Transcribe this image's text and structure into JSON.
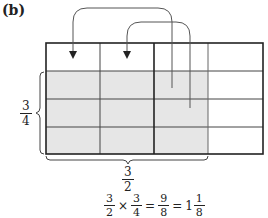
{
  "figure": {
    "part_label": "(b)",
    "grid": {
      "columns": 4,
      "rows": 4,
      "shaded_columns": 3,
      "shaded_rows_from_bottom": 3,
      "shade_color": "#e6e6e6",
      "line_color": "#333333"
    },
    "arrows": [
      {
        "from_cell": "row 2, column 3 (left part)",
        "to_cell": "row 1, column 1"
      },
      {
        "from_cell": "row 3, column 3 (right part)",
        "to_cell": "row 1, column 2"
      }
    ],
    "left_brace_label": {
      "numerator": "3",
      "denominator": "4"
    },
    "bottom_brace_label": {
      "numerator": "3",
      "denominator": "2"
    },
    "equation": {
      "a": {
        "numerator": "3",
        "denominator": "2"
      },
      "times": "×",
      "b": {
        "numerator": "3",
        "denominator": "4"
      },
      "equals1": "=",
      "product": {
        "numerator": "9",
        "denominator": "8"
      },
      "equals2": "=",
      "mixed_whole": "1",
      "mixed_frac": {
        "numerator": "1",
        "denominator": "8"
      }
    }
  }
}
